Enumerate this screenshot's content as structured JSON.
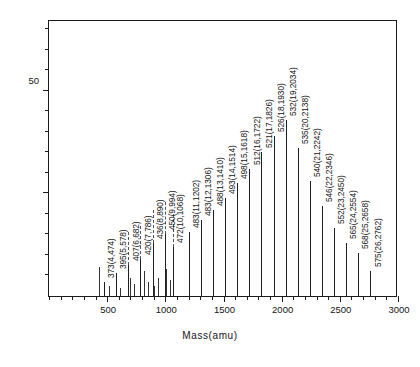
{
  "chart_data": {
    "type": "bar",
    "title": "",
    "xlabel": "Mass(amu)",
    "ylabel": "Relative intensity",
    "xlim": [
      0,
      3000
    ],
    "ylim": [
      0,
      135
    ],
    "grid": false,
    "legend": null,
    "xticks": [
      500,
      1000,
      1500,
      2000,
      2500,
      3000
    ],
    "xtick_labels": [
      "500",
      "1000",
      "1500",
      "2000",
      "2500",
      "3000"
    ],
    "xminor_step": 100,
    "yticks": [
      50,
      100
    ],
    "ytick_labels": [
      "50",
      "100"
    ],
    "yminor_step": 10,
    "label_format": "mass(n,MW)",
    "categories": [
      474,
      578,
      682,
      786,
      890,
      994,
      1068,
      1202,
      1306,
      1410,
      1514,
      1618,
      1722,
      1826,
      1930,
      2034,
      2138,
      2242,
      2346,
      2450,
      2554,
      2658,
      2762
    ],
    "values": [
      7,
      11,
      15,
      18,
      26,
      30,
      24,
      31,
      37,
      42,
      48,
      55,
      62,
      70,
      78,
      86,
      72,
      56,
      44,
      33,
      26,
      21,
      12
    ],
    "annotations": [
      {
        "label": "373(4,474)",
        "mass": 474,
        "n": 4,
        "mz": 373,
        "value": 7
      },
      {
        "label": "395(5,578)",
        "mass": 578,
        "n": 5,
        "mz": 395,
        "value": 11
      },
      {
        "label": "407(6,682)",
        "mass": 682,
        "n": 6,
        "mz": 407,
        "value": 15
      },
      {
        "label": "420(7,786)",
        "mass": 786,
        "n": 7,
        "mz": 420,
        "value": 18
      },
      {
        "label": "436(8,890)",
        "mass": 890,
        "n": 8,
        "mz": 436,
        "value": 26
      },
      {
        "label": "450(9,994)",
        "mass": 994,
        "n": 9,
        "mz": 450,
        "value": 30
      },
      {
        "label": "472(10,1068)",
        "mass": 1068,
        "n": 10,
        "mz": 472,
        "value": 24
      },
      {
        "label": "483(11,1202)",
        "mass": 1202,
        "n": 11,
        "mz": 483,
        "value": 31
      },
      {
        "label": "483(12,1306)",
        "mass": 1306,
        "n": 12,
        "mz": 483,
        "value": 37
      },
      {
        "label": "488(13,1410)",
        "mass": 1410,
        "n": 13,
        "mz": 488,
        "value": 42
      },
      {
        "label": "493(14,1514)",
        "mass": 1514,
        "n": 14,
        "mz": 493,
        "value": 48
      },
      {
        "label": "498(15,1618)",
        "mass": 1618,
        "n": 15,
        "mz": 498,
        "value": 55
      },
      {
        "label": "512(16,1722)",
        "mass": 1722,
        "n": 16,
        "mz": 512,
        "value": 62
      },
      {
        "label": "521(17,1826)",
        "mass": 1826,
        "n": 17,
        "mz": 521,
        "value": 70
      },
      {
        "label": "526(18,1930)",
        "mass": 1930,
        "n": 18,
        "mz": 526,
        "value": 78
      },
      {
        "label": "532(19,2034)",
        "mass": 2034,
        "n": 19,
        "mz": 532,
        "value": 86
      },
      {
        "label": "535(20,2138)",
        "mass": 2138,
        "n": 20,
        "mz": 535,
        "value": 72
      },
      {
        "label": "540(21,2242)",
        "mass": 2242,
        "n": 21,
        "mz": 540,
        "value": 56
      },
      {
        "label": "546(22,2346)",
        "mass": 2346,
        "n": 22,
        "mz": 546,
        "value": 44
      },
      {
        "label": "552(23,2450)",
        "mass": 2450,
        "n": 23,
        "mz": 552,
        "value": 33
      },
      {
        "label": "565(24,2554)",
        "mass": 2554,
        "n": 24,
        "mz": 565,
        "value": 26
      },
      {
        "label": "568(25,2658)",
        "mass": 2658,
        "n": 25,
        "mz": 568,
        "value": 21
      },
      {
        "label": "575(26,2762)",
        "mass": 2762,
        "n": 26,
        "mz": 575,
        "value": 12
      }
    ],
    "unlabeled_peaks": [
      {
        "mass": 430,
        "value": 14
      },
      {
        "mass": 520,
        "value": 5
      },
      {
        "mass": 610,
        "value": 4
      },
      {
        "mass": 700,
        "value": 9
      },
      {
        "mass": 730,
        "value": 6
      },
      {
        "mass": 820,
        "value": 12
      },
      {
        "mass": 850,
        "value": 7
      },
      {
        "mass": 905,
        "value": 5
      },
      {
        "mass": 935,
        "value": 9
      },
      {
        "mass": 1010,
        "value": 13
      },
      {
        "mass": 1040,
        "value": 8
      }
    ],
    "leader_lines": [
      {
        "mass": 682,
        "value": 15
      },
      {
        "mass": 786,
        "value": 18
      },
      {
        "mass": 890,
        "value": 26
      },
      {
        "mass": 994,
        "value": 30
      },
      {
        "mass": 1068,
        "value": 24
      }
    ]
  }
}
